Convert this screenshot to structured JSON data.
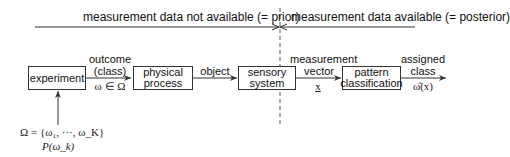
{
  "header": {
    "prior_label": "measurement data not available (= prior)",
    "posterior_label": "measurement data available (= posterior)"
  },
  "blocks": [
    {
      "id": "experiment",
      "label": "experiment"
    },
    {
      "id": "physical-process",
      "line1": "physical",
      "line2": "process"
    },
    {
      "id": "sensory-system",
      "line1": "sensory",
      "line2": "system"
    },
    {
      "id": "pattern-classification",
      "line1": "pattern",
      "line2": "classification"
    }
  ],
  "edges": {
    "outcome": {
      "line1": "outcome",
      "line2": "(class)",
      "math": "ω ∈ Ω"
    },
    "object": {
      "label": "object"
    },
    "measurement": {
      "line1": "measurement",
      "line2": "vector",
      "math": "x"
    },
    "assigned": {
      "line1": "assigned",
      "line2": "class",
      "math": "ω̂(x)"
    }
  },
  "input": {
    "set_def": "Ω = {ω₁, ···, ω_K}",
    "prior_prob": "P(ω_k)"
  },
  "colors": {
    "line": "#333333",
    "text": "#111111",
    "background": "#ffffff"
  }
}
